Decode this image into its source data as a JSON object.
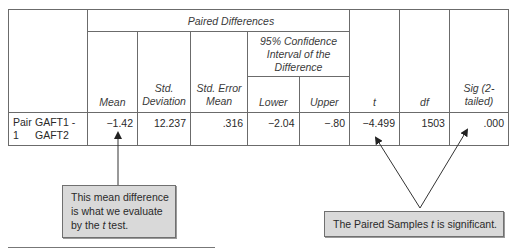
{
  "table": {
    "group_header": "Paired Differences",
    "ci_header": "95% Confidence Interval of the Difference",
    "columns": {
      "mean": "Mean",
      "std_dev": "Std. Deviation",
      "std_err": "Std. Error Mean",
      "lower": "Lower",
      "upper": "Upper",
      "t": "t",
      "df": "df",
      "sig": "Sig (2-tailed)"
    },
    "row": {
      "pair_label": "Pair 1",
      "pair_vars": "GAFT1 - GAFT2",
      "mean": "−1.42",
      "std_dev": "12.237",
      "std_err": ".316",
      "lower": "−2.04",
      "upper": "−.80",
      "t": "−4.499",
      "df": "1503",
      "sig": ".000"
    }
  },
  "callouts": {
    "left_prefix": "This mean difference is what we evaluate by the ",
    "left_italic": "t",
    "left_suffix": " test.",
    "right_prefix": "The Paired Samples ",
    "right_italic": "t",
    "right_suffix": " is significant."
  }
}
